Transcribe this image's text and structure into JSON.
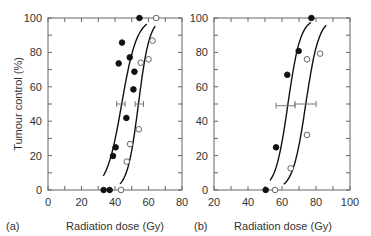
{
  "chart_data": [
    {
      "type": "scatter",
      "panel_label": "(a)",
      "title": "",
      "xlabel": "Radiation dose (Gy)",
      "ylabel": "Tumour control (%)",
      "xlim": [
        0,
        80
      ],
      "ylim": [
        0,
        100
      ],
      "xticks": [
        0,
        20,
        40,
        60,
        80
      ],
      "yticks": [
        0,
        20,
        40,
        60,
        80,
        100
      ],
      "grid": false,
      "series": [
        {
          "name": "filled",
          "marker": "filled-circle",
          "points": [
            {
              "x": 54.6,
              "y": 100
            },
            {
              "x": 44.2,
              "y": 85.7
            },
            {
              "x": 42.2,
              "y": 73.6
            },
            {
              "x": 48.8,
              "y": 77.1
            },
            {
              "x": 51.6,
              "y": 68.8
            },
            {
              "x": 51.0,
              "y": 58.5
            },
            {
              "x": 46.8,
              "y": 41.9
            },
            {
              "x": 40.4,
              "y": 24.8
            },
            {
              "x": 38.8,
              "y": 19.8
            },
            {
              "x": 33.2,
              "y": 0
            },
            {
              "x": 36.8,
              "y": 0
            }
          ],
          "fit": {
            "d50": 44,
            "k": 0.22,
            "x_range": [
              33,
              59
            ]
          },
          "d50_errorbar": {
            "x": 44,
            "y": 50,
            "low": 41,
            "high": 46
          }
        },
        {
          "name": "open",
          "marker": "open-circle",
          "points": [
            {
              "x": 64.6,
              "y": 100
            },
            {
              "x": 62.4,
              "y": 86.8
            },
            {
              "x": 60.0,
              "y": 76
            },
            {
              "x": 55.4,
              "y": 74
            },
            {
              "x": 54.2,
              "y": 35.3
            },
            {
              "x": 49.0,
              "y": 26.7
            },
            {
              "x": 47.0,
              "y": 16.5
            },
            {
              "x": 43.6,
              "y": 0
            }
          ],
          "fit": {
            "d50": 54,
            "k": 0.3,
            "x_range": [
              43,
              64
            ]
          },
          "d50_errorbar": {
            "x": 54,
            "y": 50,
            "low": 52,
            "high": 57
          }
        }
      ]
    },
    {
      "type": "scatter",
      "panel_label": "(b)",
      "title": "",
      "xlabel": "Radiation dose (Gy)",
      "ylabel": "",
      "xlim": [
        20,
        100
      ],
      "ylim": [
        0,
        100
      ],
      "xticks": [
        20,
        40,
        60,
        80,
        100
      ],
      "yticks": [
        0,
        20,
        40,
        60,
        80,
        100
      ],
      "grid": false,
      "series": [
        {
          "name": "filled",
          "marker": "filled-circle",
          "points": [
            {
              "x": 77.3,
              "y": 100
            },
            {
              "x": 69.8,
              "y": 80.8
            },
            {
              "x": 63.1,
              "y": 67
            },
            {
              "x": 56.5,
              "y": 24.8
            },
            {
              "x": 50.4,
              "y": 0
            }
          ],
          "fit": {
            "d50": 63.5,
            "k": 0.27,
            "x_range": [
              53,
              77
            ]
          },
          "d50_errorbar": {
            "x": 63.5,
            "y": 49,
            "low": 56.5,
            "high": 67.6
          }
        },
        {
          "name": "open",
          "marker": "open-circle",
          "points": [
            {
              "x": 82.4,
              "y": 79.3
            },
            {
              "x": 74.7,
              "y": 76
            },
            {
              "x": 74.7,
              "y": 32
            },
            {
              "x": 65.1,
              "y": 12.6
            },
            {
              "x": 55.9,
              "y": 0
            }
          ],
          "fit": {
            "d50": 74,
            "k": 0.26,
            "x_range": [
              61,
              86
            ]
          },
          "d50_errorbar": {
            "x": 74,
            "y": 50,
            "low": 67.6,
            "high": 80
          }
        }
      ]
    }
  ]
}
